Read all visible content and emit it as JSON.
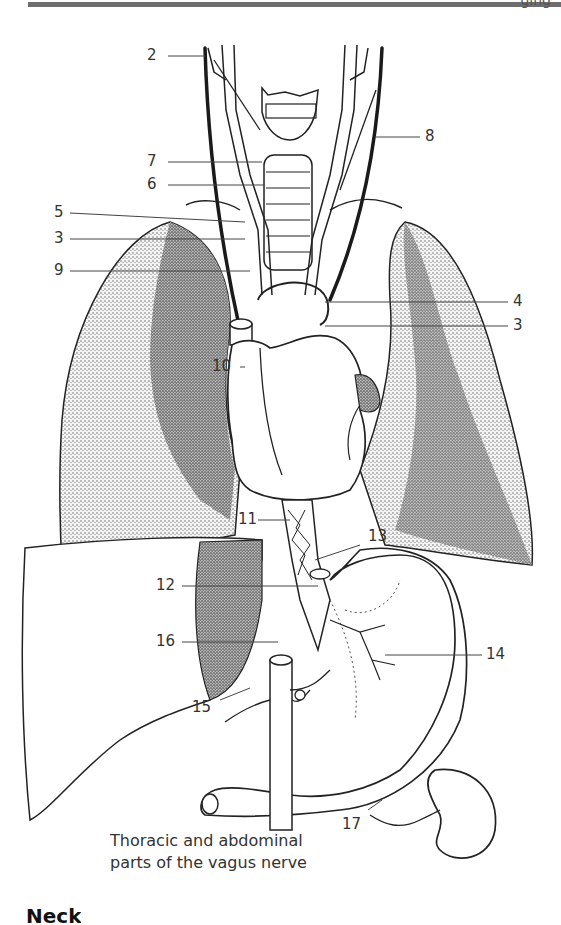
{
  "page": {
    "header_partial_text": "ging",
    "section_heading_partial": "Neck"
  },
  "diagram": {
    "caption_line1": "Thoracic and abdominal",
    "caption_line2": "parts of the vagus nerve",
    "labels": [
      {
        "id": "2",
        "text": "2",
        "side": "left"
      },
      {
        "id": "8",
        "text": "8",
        "side": "right"
      },
      {
        "id": "7",
        "text": "7",
        "side": "left"
      },
      {
        "id": "6",
        "text": "6",
        "side": "left"
      },
      {
        "id": "5",
        "text": "5",
        "side": "left"
      },
      {
        "id": "3a",
        "text": "3",
        "side": "left"
      },
      {
        "id": "9",
        "text": "9",
        "side": "left"
      },
      {
        "id": "4",
        "text": "4",
        "side": "right"
      },
      {
        "id": "3b",
        "text": "3",
        "side": "right"
      },
      {
        "id": "10",
        "text": "10",
        "side": "left"
      },
      {
        "id": "11",
        "text": "11",
        "side": "left"
      },
      {
        "id": "13",
        "text": "13",
        "side": "right"
      },
      {
        "id": "12",
        "text": "12",
        "side": "left"
      },
      {
        "id": "16",
        "text": "16",
        "side": "left"
      },
      {
        "id": "14",
        "text": "14",
        "side": "right"
      },
      {
        "id": "15",
        "text": "15",
        "side": "left"
      },
      {
        "id": "17",
        "text": "17",
        "side": "right"
      }
    ],
    "structures": [
      "larynx",
      "trachea",
      "carotid arteries",
      "vagus nerves",
      "lungs",
      "heart",
      "esophagus",
      "liver",
      "stomach",
      "celiac trunk",
      "spleen/kidney",
      "aorta"
    ],
    "colors": {
      "ink": "#222222",
      "lung_stipple": "#9a9a9a",
      "paper": "#ffffff"
    }
  }
}
